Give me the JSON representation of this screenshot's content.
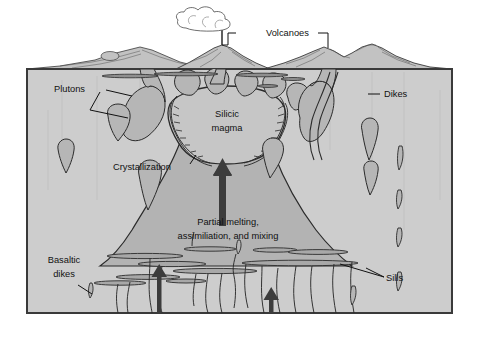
{
  "figure": {
    "type": "geological-cross-section-diagram"
  },
  "colors": {
    "page_background": "#ffffff",
    "crust_fill": "#cdcdcd",
    "crust_border": "#3a3a3a",
    "magma_body_fill": "#b3b3b3",
    "magma_chamber_fill": "#c6c6c6",
    "pluton_fill": "#b6b6b6",
    "sill_fill": "#a8a8a8",
    "outline": "#2b2b2b",
    "arrow_fill": "#3c3c3c",
    "leader_line": "#111111",
    "cloud_fill": "#ffffff",
    "volcano_fill": "#c2c2c2",
    "label_text": "#111111"
  },
  "labels": {
    "volcanoes": "Volcanoes",
    "plutons": "Plutons",
    "dikes": "Dikes",
    "silicic_magma_line1": "Silicic",
    "silicic_magma_line2": "magma",
    "crystallization": "Crystallization",
    "partial_melting_line1": "Partial melting,",
    "partial_melting_line2": "assimiliation, and mixing",
    "basaltic_dikes_line1": "Basaltic",
    "basaltic_dikes_line2": "dikes",
    "sills": "Sills"
  },
  "features": {
    "eruption_plume": "cloud",
    "ascent_arrows": 3,
    "volcano_cones": 3,
    "surface_line": "ground-surface"
  }
}
